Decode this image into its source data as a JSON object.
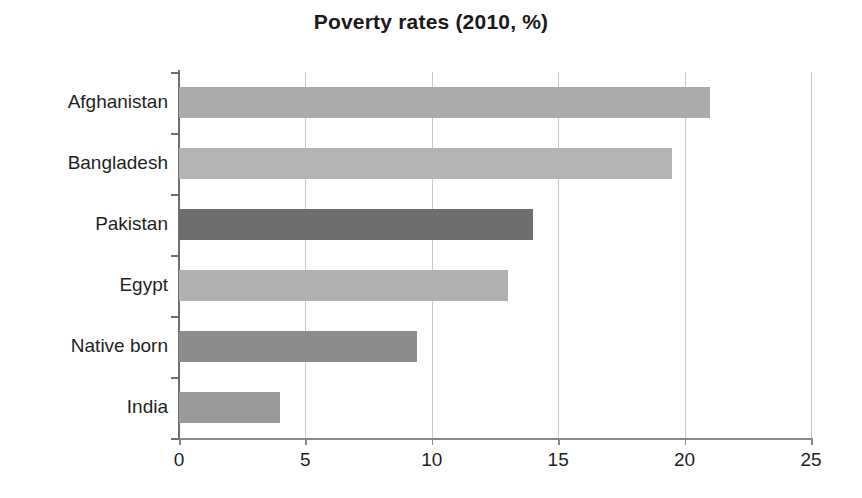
{
  "chart_data": {
    "type": "bar",
    "orientation": "horizontal",
    "title": "Poverty rates (2010, %)",
    "xlabel": "",
    "ylabel": "",
    "xlim": [
      0,
      25
    ],
    "xticks": [
      0,
      5,
      10,
      15,
      20,
      25
    ],
    "grid": "vertical",
    "legend": "none",
    "categories": [
      "Afghanistan",
      "Bangladesh",
      "Pakistan",
      "Egypt",
      "Native born",
      "India"
    ],
    "values": [
      21,
      19.5,
      14,
      13,
      9.4,
      4
    ],
    "bar_colors": [
      "#ababab",
      "#b3b3b3",
      "#6e6e6e",
      "#b0b0b0",
      "#8c8c8c",
      "#9a9a9a"
    ],
    "background_color": "#ffffff",
    "axis_color": "#6f6f6f",
    "gridline_color": "#c9c9c9",
    "text_color": "#1f1f1f"
  }
}
